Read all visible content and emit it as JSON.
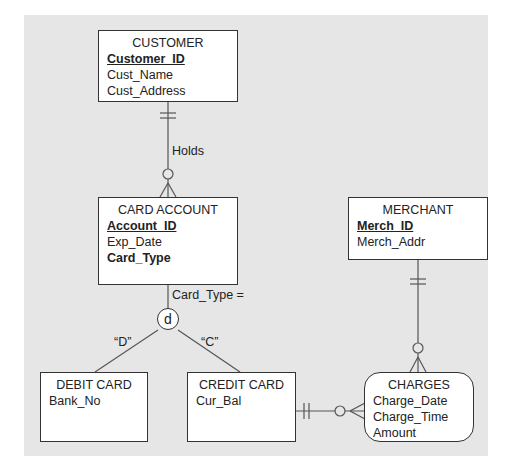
{
  "entities": {
    "customer": {
      "name": "CUSTOMER",
      "attributes": [
        {
          "text": "Customer_ID",
          "style": "pk"
        },
        {
          "text": "Cust_Name",
          "style": "normal"
        },
        {
          "text": "Cust_Address",
          "style": "normal"
        }
      ]
    },
    "card_account": {
      "name": "CARD ACCOUNT",
      "attributes": [
        {
          "text": "Account_ID",
          "style": "pk"
        },
        {
          "text": "Exp_Date",
          "style": "normal"
        },
        {
          "text": "Card_Type",
          "style": "bold"
        }
      ]
    },
    "merchant": {
      "name": "MERCHANT",
      "attributes": [
        {
          "text": "Merch_ID",
          "style": "pk"
        },
        {
          "text": "Merch_Addr",
          "style": "normal"
        }
      ]
    },
    "debit_card": {
      "name": "DEBIT CARD",
      "attributes": [
        {
          "text": "Bank_No",
          "style": "normal"
        }
      ]
    },
    "credit_card": {
      "name": "CREDIT CARD",
      "attributes": [
        {
          "text": "Cur_Bal",
          "style": "normal"
        }
      ]
    },
    "charges": {
      "name": "CHARGES",
      "attributes": [
        {
          "text": "Charge_Date",
          "style": "normal"
        },
        {
          "text": "Charge_Time",
          "style": "normal"
        },
        {
          "text": "Amount",
          "style": "normal"
        }
      ]
    }
  },
  "relationships": {
    "holds": "Holds",
    "subtype_discriminator": "Card_Type =",
    "disjoint_symbol": "d",
    "debit_value": "“D”",
    "credit_value": "“C”"
  },
  "colors": {
    "background": "#e6e6e6",
    "entity_fill": "#ffffff",
    "line": "#555555"
  }
}
